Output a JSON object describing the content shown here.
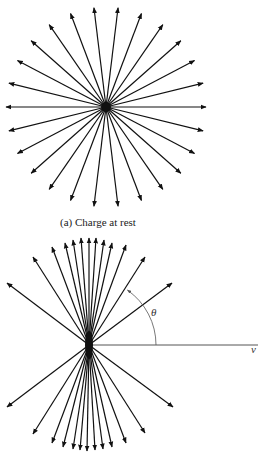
{
  "figure_a": {
    "caption": "(a) Charge at rest",
    "center": [
      106,
      107
    ],
    "radius": 100,
    "arrow_count": 26,
    "line_color": "#111111"
  },
  "figure_b": {
    "center": [
      89,
      345
    ],
    "tips": [
      [
        172,
        283
      ],
      [
        145,
        257
      ],
      [
        126,
        245
      ],
      [
        112,
        243
      ],
      [
        104,
        240
      ],
      [
        96,
        238
      ],
      [
        89,
        238
      ],
      [
        81,
        238
      ],
      [
        73,
        240
      ],
      [
        65,
        243
      ],
      [
        52,
        247
      ],
      [
        33,
        257
      ],
      [
        7,
        283
      ],
      [
        7,
        407
      ],
      [
        33,
        434
      ],
      [
        52,
        443
      ],
      [
        63,
        447
      ],
      [
        73,
        449
      ],
      [
        80,
        450
      ],
      [
        87,
        451
      ],
      [
        95,
        450
      ],
      [
        103,
        449
      ],
      [
        112,
        447
      ],
      [
        126,
        443
      ],
      [
        145,
        433
      ],
      [
        173,
        407
      ]
    ],
    "velocity_axis_end": [
      258,
      345
    ],
    "velocity_label": "v",
    "angle_label": "θ",
    "arc_radius": 67,
    "arc_end_angle_deg": 55,
    "line_color": "#111111",
    "axis_color": "#555555"
  }
}
